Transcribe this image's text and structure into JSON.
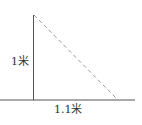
{
  "diagram": {
    "labels": {
      "height": "1米",
      "base": "1.1米"
    },
    "colors": {
      "solid_line": "#555555",
      "dashed_line": "#999999",
      "text": "#333333"
    },
    "geometry": {
      "vertical_line": {
        "x": 33,
        "y1": 15,
        "y2": 100
      },
      "baseline": {
        "x1": 0,
        "x2": 135,
        "y": 100
      },
      "dashed_hypotenuse": {
        "x1": 33,
        "y1": 15,
        "x2": 118,
        "y2": 100
      }
    }
  }
}
